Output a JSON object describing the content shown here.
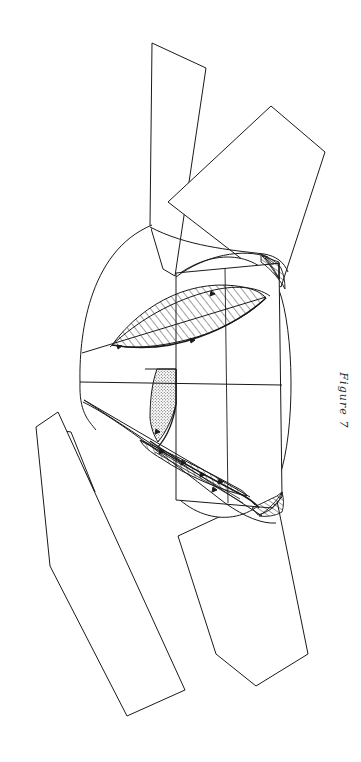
{
  "document": {
    "type": "patent-figure",
    "background_color": "#ffffff",
    "ink_color": "#1a1a1a",
    "page_width": 361,
    "page_height": 762
  },
  "caption": {
    "label": "Figure 7",
    "orientation": "rotated-90-clockwise",
    "color": "#2b2b2b"
  },
  "figure": {
    "title": "Figure 7",
    "orientation": "landscape-drawing-rotated-90",
    "line_color": "#1a1a1a",
    "fill_color": "#ffffff",
    "elements": [
      {
        "name": "upper-left-blade",
        "description": "elongated quadrilateral blade arm extending to upper left"
      },
      {
        "name": "upper-right-blade",
        "description": "elongated quadrilateral blade arm extending to upper right"
      },
      {
        "name": "lower-left-blade-thin",
        "description": "narrow sliver blade arm extending to lower left"
      },
      {
        "name": "lower-left-blade",
        "description": "elongated quadrilateral blade arm extending to lower left"
      },
      {
        "name": "lower-right-blade",
        "description": "elongated quadrilateral blade arm extending to lower right"
      },
      {
        "name": "hub-arc",
        "description": "rounded arc forming the left apex hub"
      },
      {
        "name": "center-axis-line",
        "description": "horizontal centerline through the body"
      },
      {
        "name": "body-rectangle",
        "description": "right-hand rectangular cylinder body in section"
      },
      {
        "name": "upper-hatched-lens",
        "description": "large crosshatched lens-shaped sectioned region, upper"
      },
      {
        "name": "lower-hatched-lens",
        "description": "narrow hatched lens-shaped sectioned region, lower"
      },
      {
        "name": "upper-right-hatched-wedge",
        "description": "small hatched wedge at top of body rectangle"
      },
      {
        "name": "lower-right-hatched-wedge",
        "description": "small hatched wedge at bottom of body rectangle"
      },
      {
        "name": "stippled-crescent",
        "description": "dotted/stippled crescent region left of body centerline"
      },
      {
        "name": "section-tick-marks",
        "description": "small arrowhead tick marks along section boundaries"
      }
    ]
  }
}
